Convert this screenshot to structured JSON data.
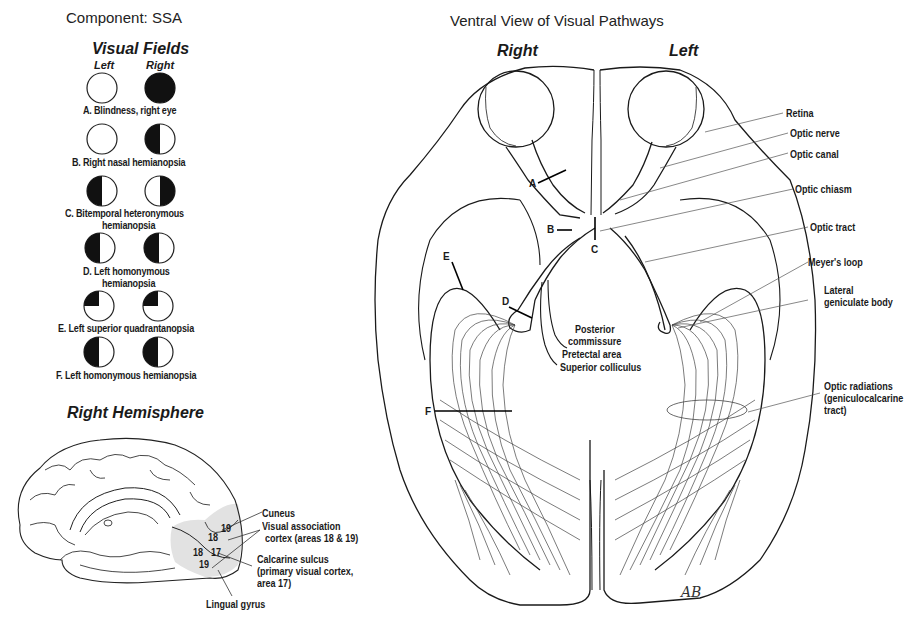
{
  "component_title": "Component: SSA",
  "diagram_title": "Ventral View of Visual Pathways",
  "visual_fields": {
    "heading": "Visual Fields",
    "column_left": "Left",
    "column_right": "Right",
    "items": [
      {
        "letter": "A",
        "caption_line1": "A. Blindness, right eye",
        "caption_line2": "",
        "left_eye": "open",
        "right_eye": "full-black"
      },
      {
        "letter": "B",
        "caption_line1": "B. Right nasal hemianopsia",
        "caption_line2": "",
        "left_eye": "open",
        "right_eye": "left-half-black"
      },
      {
        "letter": "C",
        "caption_line1": "C. Bitemporal heteronymous",
        "caption_line2": "hemianopsia",
        "left_eye": "left-half-black",
        "right_eye": "right-half-black"
      },
      {
        "letter": "D",
        "caption_line1": "D. Left homonymous",
        "caption_line2": "hemianopsia",
        "left_eye": "left-half-black",
        "right_eye": "left-half-black"
      },
      {
        "letter": "E",
        "caption_line1": "E. Left superior quadrantanopsia",
        "caption_line2": "",
        "left_eye": "upper-left-quadrant-black",
        "right_eye": "upper-left-quadrant-black"
      },
      {
        "letter": "F",
        "caption_line1": "F. Left homonymous hemianopsia",
        "caption_line2": "",
        "left_eye": "left-half-black",
        "right_eye": "left-half-black"
      }
    ]
  },
  "hemisphere": {
    "heading": "Right Hemisphere",
    "area_numbers": [
      "19",
      "18",
      "17",
      "18",
      "19"
    ],
    "labels": {
      "cuneus": "Cuneus",
      "visual_assoc_1": "Visual association",
      "visual_assoc_2": "cortex (areas 18 & 19)",
      "calcarine_1": "Calcarine sulcus",
      "calcarine_2": "(primary visual cortex,",
      "calcarine_3": "area 17)",
      "lingual": "Lingual gyrus"
    },
    "shade_color": "#e2e2e2"
  },
  "ventral_view": {
    "side_right": "Right",
    "side_left": "Left",
    "lesion_markers": [
      "A",
      "B",
      "C",
      "D",
      "E",
      "F"
    ],
    "labels": {
      "retina": "Retina",
      "optic_nerve": "Optic nerve",
      "optic_canal": "Optic canal",
      "optic_chiasm": "Optic chiasm",
      "optic_tract": "Optic tract",
      "meyers_loop": "Meyer's loop",
      "lgb_1": "Lateral",
      "lgb_2": "geniculate body",
      "radiations_1": "Optic radiations",
      "radiations_2": "(geniculocalcarine",
      "radiations_3": "tract)",
      "posterior_1": "Posterior",
      "posterior_2": "commissure",
      "pretectal": "Pretectal area",
      "superior_colliculus": "Superior colliculus"
    },
    "signature": "AB"
  }
}
